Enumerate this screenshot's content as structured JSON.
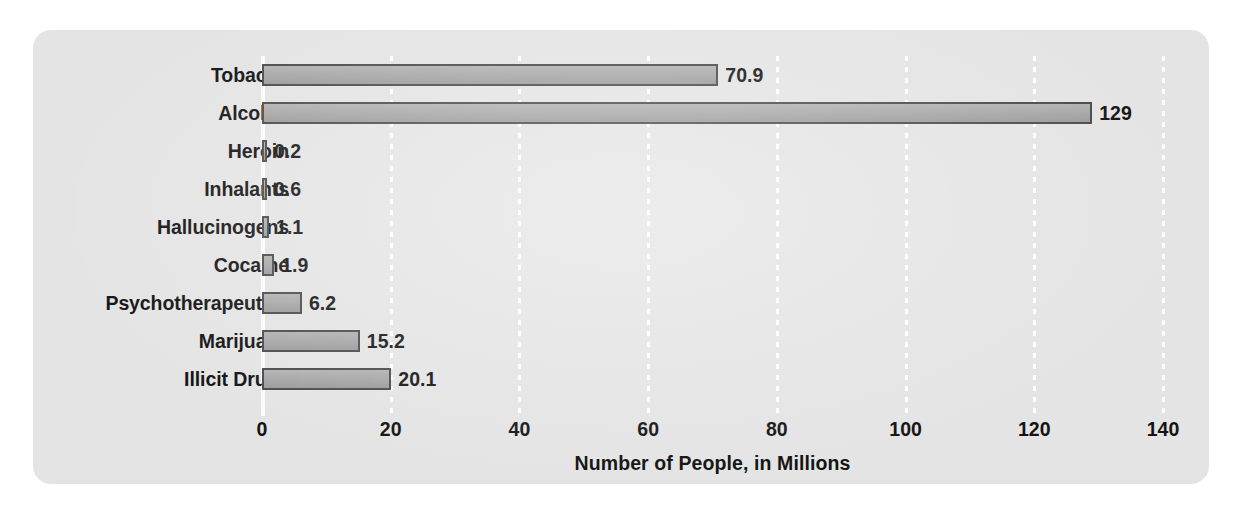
{
  "chart_data": {
    "type": "bar",
    "orientation": "horizontal",
    "title": "",
    "xlabel": "Number of People, in Millions",
    "ylabel": "",
    "xlim": [
      0,
      145
    ],
    "xticks": [
      0,
      20,
      40,
      60,
      80,
      100,
      120,
      140
    ],
    "xtick_labels": [
      "0",
      "20",
      "40",
      "60",
      "80",
      "100",
      "120",
      "140"
    ],
    "grid": "vertical-dotted-white",
    "legend": "none",
    "categories": [
      "Tobacco",
      "Alcohol",
      "Heroin",
      "Inhalants",
      "Hallucinogens",
      "Cocaine",
      "Psychotherapeutics",
      "Marijuana",
      "Illicit Drugs"
    ],
    "values": [
      70.9,
      129,
      0.2,
      0.6,
      1.1,
      1.9,
      6.2,
      15.2,
      20.1
    ],
    "value_labels": [
      "70.9",
      "129",
      "0.2",
      "0.6",
      "1.1",
      "1.9",
      "6.2",
      "15.2",
      "20.1"
    ],
    "bars": [
      {
        "label": "Tobacco",
        "value": 70.9,
        "value_label": "70.9"
      },
      {
        "label": "Alcohol",
        "value": 129,
        "value_label": "129"
      },
      {
        "label": "Heroin",
        "value": 0.2,
        "value_label": "0.2"
      },
      {
        "label": "Inhalants",
        "value": 0.6,
        "value_label": "0.6"
      },
      {
        "label": "Hallucinogens",
        "value": 1.1,
        "value_label": "1.1"
      },
      {
        "label": "Cocaine",
        "value": 1.9,
        "value_label": "1.9"
      },
      {
        "label": "Psychotherapeutics",
        "value": 6.2,
        "value_label": "6.2"
      },
      {
        "label": "Marijuana",
        "value": 15.2,
        "value_label": "15.2"
      },
      {
        "label": "Illicit Drugs",
        "value": 20.1,
        "value_label": "20.1"
      }
    ],
    "colors": {
      "bar_fill": "#a8a8a8",
      "bar_border": "#4a4a4a",
      "card_background": "#e4e4e4",
      "page_background": "#ffffff",
      "gridline": "#ffffff",
      "text": "#141414"
    }
  }
}
